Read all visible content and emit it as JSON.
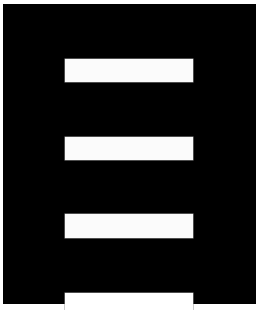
{
  "graphic": {
    "description": "black panel with three white horizontal bars and a bottom notch",
    "icon": "ladder-icon",
    "colors": {
      "background": "#ffffff",
      "panel": "#000000",
      "bars": "#fbfbfb"
    },
    "bar_count": 3
  }
}
